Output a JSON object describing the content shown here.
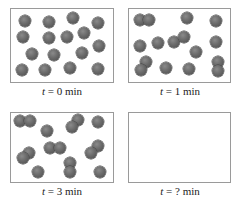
{
  "figure": {
    "panels": [
      {
        "id": "t0",
        "label_var": "t",
        "label_eq": " = 0 min",
        "box": {
          "x": 10,
          "y": 8,
          "w": 104,
          "h": 75
        },
        "label_y": 85,
        "single_atoms": 16,
        "pairs": 0,
        "dots": [
          [
            25,
            21
          ],
          [
            49,
            22
          ],
          [
            73,
            18
          ],
          [
            98,
            23
          ],
          [
            23,
            37
          ],
          [
            49,
            38
          ],
          [
            67,
            37
          ],
          [
            84,
            33
          ],
          [
            99,
            46
          ],
          [
            32,
            54
          ],
          [
            54,
            55
          ],
          [
            82,
            53
          ],
          [
            22,
            70
          ],
          [
            45,
            70
          ],
          [
            70,
            68
          ],
          [
            98,
            69
          ]
        ]
      },
      {
        "id": "t1",
        "label_var": "t",
        "label_eq": " = 1 min",
        "box": {
          "x": 128,
          "y": 8,
          "w": 103,
          "h": 75
        },
        "label_y": 85,
        "single_atoms": 8,
        "pairs": 4,
        "dots": [
          [
            140,
            20
          ],
          [
            149,
            20
          ],
          [
            187,
            18
          ],
          [
            216,
            21
          ],
          [
            140,
            46
          ],
          [
            158,
            43
          ],
          [
            174,
            42
          ],
          [
            184,
            37
          ],
          [
            196,
            52
          ],
          [
            216,
            42
          ],
          [
            146,
            62
          ],
          [
            141,
            70
          ],
          [
            166,
            68
          ],
          [
            189,
            69
          ],
          [
            218,
            62
          ],
          [
            218,
            71
          ]
        ]
      },
      {
        "id": "t3",
        "label_var": "t",
        "label_eq": " = 3 min",
        "box": {
          "x": 10,
          "y": 112,
          "w": 104,
          "h": 71
        },
        "label_y": 185,
        "single_atoms": 4,
        "pairs": 6,
        "dots": [
          [
            20,
            121
          ],
          [
            30,
            121
          ],
          [
            47,
            131
          ],
          [
            78,
            120
          ],
          [
            72,
            127
          ],
          [
            98,
            122
          ],
          [
            29,
            153
          ],
          [
            23,
            158
          ],
          [
            50,
            148
          ],
          [
            60,
            148
          ],
          [
            98,
            146
          ],
          [
            91,
            153
          ],
          [
            38,
            172
          ],
          [
            70,
            163
          ],
          [
            70,
            172
          ],
          [
            100,
            172
          ]
        ]
      },
      {
        "id": "tq",
        "label_var": "t",
        "label_eq": " = ? min",
        "box": {
          "x": 128,
          "y": 112,
          "w": 103,
          "h": 71
        },
        "label_y": 185,
        "single_atoms": 0,
        "pairs": 0,
        "dots": []
      }
    ],
    "colors": {
      "particle_light": "#8a8a8a",
      "particle_dark": "#4a4a4a",
      "border": "#9a9a9a",
      "text": "#222222"
    }
  }
}
